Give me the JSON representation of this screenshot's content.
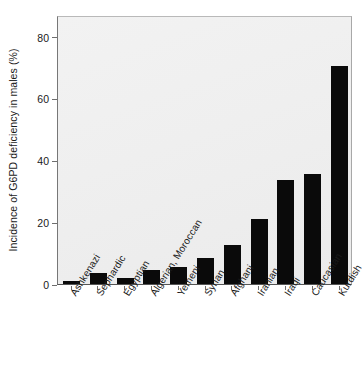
{
  "chart_data": {
    "type": "bar",
    "title": "",
    "xlabel": "",
    "ylabel": "Incidence of G6PD deficiency in males (%)",
    "ylim": [
      0,
      87
    ],
    "yticks": [
      0,
      20,
      40,
      60,
      80
    ],
    "ytick_labels": [
      "0",
      "20",
      "40",
      "60",
      "80"
    ],
    "grid": false,
    "legend": null,
    "bar_color": "#0a0a0a",
    "plot_background": "#efefef",
    "categories": [
      "Ashkenazi",
      "Sephardic",
      "Egyptian",
      "Algerian, Moroccan",
      "Yemeni",
      "Syrian",
      "Afghani",
      "Iranian",
      "Iraqi",
      "Caucasian",
      "Kurdish"
    ],
    "values": [
      1,
      3.5,
      2,
      4.5,
      5.5,
      8.5,
      12.5,
      21,
      33.5,
      35.5,
      70.5
    ]
  }
}
